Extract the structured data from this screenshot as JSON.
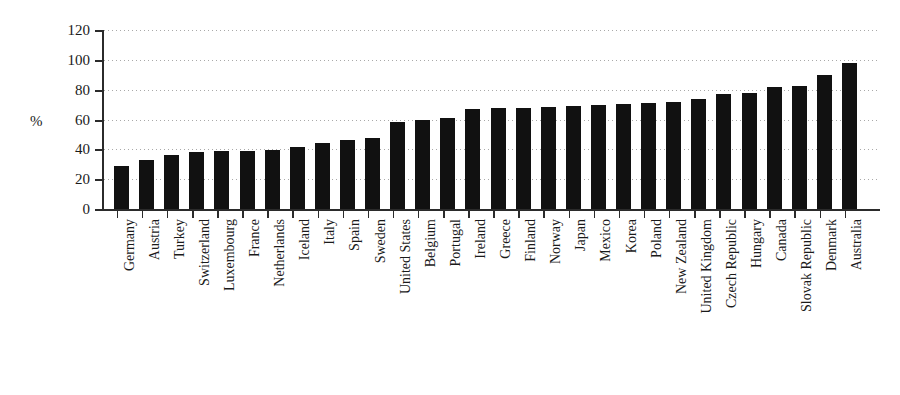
{
  "chart_data": {
    "type": "bar",
    "title": "",
    "subtitle": "",
    "xlabel": "",
    "ylabel": "%",
    "ylim": [
      0,
      120
    ],
    "yticks": [
      0,
      20,
      40,
      60,
      80,
      100,
      120
    ],
    "grid": true,
    "legend": "none",
    "bar_color": "#111111",
    "axis_color": "#2b2b2b",
    "grid_color": "#9a9a9a",
    "categories": [
      "Germany",
      "Austria",
      "Turkey",
      "Switzerland",
      "Luxembourg",
      "France",
      "Netherlands",
      "Iceland",
      "Italy",
      "Spain",
      "Sweden",
      "United States",
      "Belgium",
      "Portugal",
      "Ireland",
      "Greece",
      "Finland",
      "Norway",
      "Japan",
      "Mexico",
      "Korea",
      "Poland",
      "New Zealand",
      "United Kingdom",
      "Czech Republic",
      "Hungary",
      "Canada",
      "Slovak Republic",
      "Denmark",
      "Australia"
    ],
    "values": [
      29,
      33,
      36,
      38.5,
      39,
      39,
      39.5,
      41.5,
      44.5,
      46.5,
      47.5,
      58,
      60,
      61,
      67,
      67.5,
      68,
      68.5,
      69,
      69.5,
      70.5,
      71,
      72,
      74,
      77,
      78,
      82,
      82.5,
      90,
      98
    ]
  }
}
